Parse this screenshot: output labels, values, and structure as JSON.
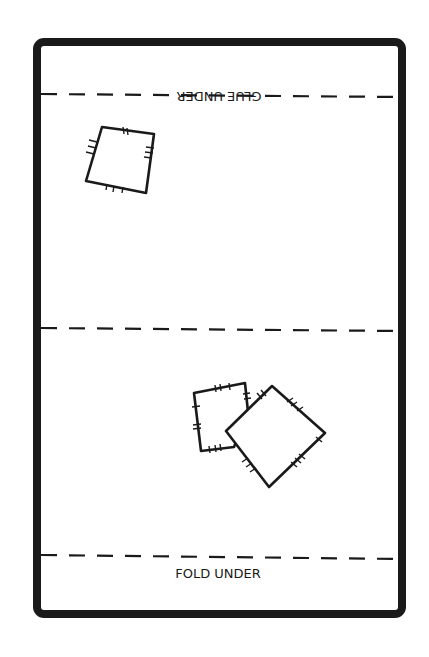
{
  "template": {
    "title": "Foldable paper template",
    "labels": {
      "top_fold_label": "GLUE UNDER",
      "top_fold_label_orientation": "upside-down",
      "bottom_fold_label": "FOLD UNDER"
    },
    "fold_lines": [
      {
        "name": "top-fold-line",
        "style": "dashed"
      },
      {
        "name": "middle-fold-line",
        "style": "dashed"
      },
      {
        "name": "bottom-fold-line",
        "style": "dashed"
      }
    ],
    "shapes": [
      {
        "name": "quadrilateral-top-left",
        "section": "top panel",
        "tick_marks": true
      },
      {
        "name": "quadrilateral-bottom-small",
        "section": "bottom panel",
        "tick_marks": true
      },
      {
        "name": "quadrilateral-bottom-large",
        "section": "bottom panel",
        "tick_marks": true
      }
    ],
    "colors": {
      "stroke": "#1a1a1a",
      "background": "#ffffff"
    }
  }
}
